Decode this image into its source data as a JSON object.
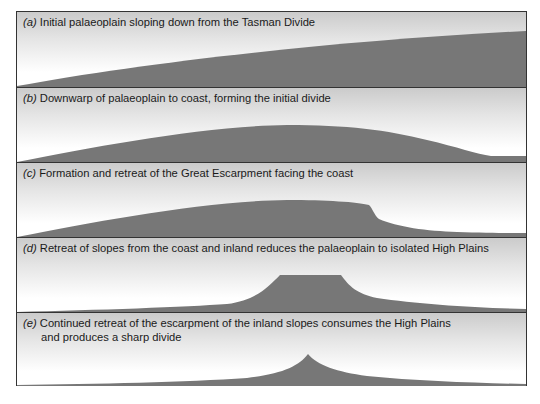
{
  "figure": {
    "fill_color": "#777777",
    "background_top": "#cbcbcb",
    "background_bottom": "#ffffff",
    "border_color": "#333333"
  },
  "panels": [
    {
      "letter": "(a)",
      "caption": "Initial palaeoplain sloping down from the Tasman Divide",
      "caption_line2": "",
      "profile": "gentle slope rising from coast (left) to the Tasman Divide (right)"
    },
    {
      "letter": "(b)",
      "caption": "Downwarp of palaeoplain to coast, forming the initial divide",
      "caption_line2": "",
      "profile": "broad arch with crest in the middle, descending to a low flat at right"
    },
    {
      "letter": "(c)",
      "caption": "Formation and retreat of the Great Escarpment facing the coast",
      "caption_line2": "",
      "profile": "arch truncated on the right by a steep escarpment, then a concave slope down"
    },
    {
      "letter": "(d)",
      "caption": "Retreat of slopes from the coast and inland reduces the palaeoplain to isolated High Plains",
      "caption_line2": "",
      "profile": "flat-topped plateau (High Plains) with concave slopes on both sides"
    },
    {
      "letter": "(e)",
      "caption": "Continued retreat of the escarpment of the inland slopes consumes the High Plains",
      "caption_line2": "and produces a sharp divide",
      "profile": "sharp peaked divide with concave slopes on both sides"
    }
  ]
}
